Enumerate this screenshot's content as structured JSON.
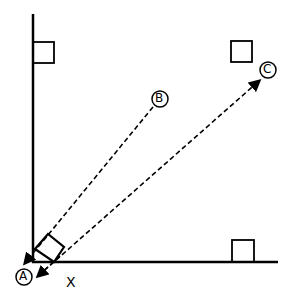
{
  "diagram": {
    "points": [
      {
        "id": "A",
        "label": "A",
        "cx": 24,
        "cy": 277
      },
      {
        "id": "B",
        "label": "B",
        "cx": 160,
        "cy": 99
      },
      {
        "id": "C",
        "label": "C",
        "cx": 268,
        "cy": 70
      }
    ],
    "axis_label": "X"
  }
}
